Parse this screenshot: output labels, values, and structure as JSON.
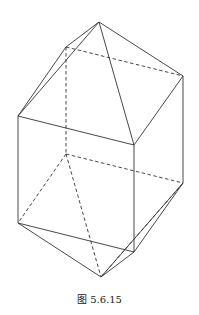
{
  "figure": {
    "caption": "图 5.6.15"
  },
  "vertices": {
    "top_apex": [
      99,
      22
    ],
    "top_back_left": [
      66,
      47
    ],
    "top_back_right": [
      183,
      76
    ],
    "top_front_left": [
      18,
      116
    ],
    "top_front_right": [
      134,
      145
    ],
    "bottom_back_left": [
      66,
      154
    ],
    "bottom_back_right": [
      183,
      183
    ],
    "bottom_front_left": [
      18,
      223
    ],
    "bottom_front_right": [
      134,
      252
    ],
    "bottom_apex": [
      101,
      277
    ]
  },
  "edges": {
    "solid": [
      [
        "top_apex",
        "top_back_left"
      ],
      [
        "top_apex",
        "top_back_right"
      ],
      [
        "top_apex",
        "top_front_left"
      ],
      [
        "top_apex",
        "top_front_right"
      ],
      [
        "top_back_left",
        "top_front_left"
      ],
      [
        "top_back_right",
        "top_front_right"
      ],
      [
        "top_front_left",
        "top_front_right"
      ],
      [
        "top_front_left",
        "bottom_front_left"
      ],
      [
        "top_front_right",
        "bottom_front_right"
      ],
      [
        "top_back_right",
        "bottom_back_right"
      ],
      [
        "bottom_front_left",
        "bottom_front_right"
      ],
      [
        "bottom_front_right",
        "bottom_back_right"
      ],
      [
        "bottom_front_left",
        "bottom_apex"
      ],
      [
        "bottom_front_right",
        "bottom_apex"
      ],
      [
        "bottom_back_right",
        "bottom_apex"
      ]
    ],
    "dashed": [
      [
        "top_back_left",
        "top_back_right"
      ],
      [
        "top_back_left",
        "bottom_back_left"
      ],
      [
        "bottom_back_left",
        "bottom_back_right"
      ],
      [
        "bottom_back_left",
        "bottom_front_left"
      ],
      [
        "bottom_back_left",
        "bottom_apex"
      ],
      [
        "bottom_back_right",
        "bottom_apex"
      ]
    ]
  }
}
